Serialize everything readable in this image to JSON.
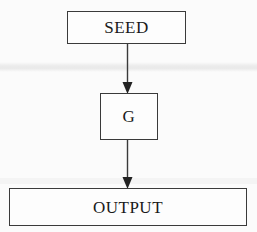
{
  "diagram": {
    "background_color": "#fbfbfb",
    "stroke_color": "#3a3a3a",
    "text_color": "#1a1a1a",
    "nodes": [
      {
        "id": "seed",
        "label": "SEED",
        "shape": "rectangle",
        "x": 67,
        "y": 11,
        "width": 119,
        "height": 33
      },
      {
        "id": "g",
        "label": "G",
        "shape": "rectangle",
        "x": 100,
        "y": 93,
        "width": 58,
        "height": 47
      },
      {
        "id": "output",
        "label": "OUTPUT",
        "shape": "rectangle",
        "x": 9,
        "y": 188,
        "width": 238,
        "height": 38
      }
    ],
    "edges": [
      {
        "id": "seed-g",
        "from": "seed",
        "to": "g",
        "direction": "down",
        "arrowhead": "filled-triangle"
      },
      {
        "id": "g-output",
        "from": "g",
        "to": "output",
        "direction": "down",
        "arrowhead": "filled-triangle"
      }
    ]
  }
}
